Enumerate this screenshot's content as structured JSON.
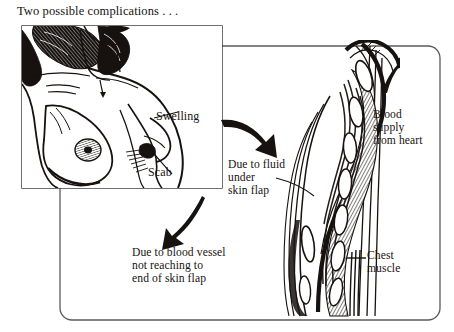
{
  "figure": {
    "title": "Two possible complications . . .",
    "background_color": "#ffffff",
    "ink_color": "#17120f",
    "frame_color": "#5b5b5b",
    "type": "medical-line-illustration"
  },
  "labels": {
    "swelling": "Swelling",
    "scab": "Scab",
    "fluid_cause": "Due to fluid\nunder\nskin flap",
    "vessel_cause": "Due to blood vessel\nnot reaching to\nend of skin flap",
    "blood_supply": "Blood\nsupply\nfrom heart",
    "chest_muscle": "Chest\nmuscle"
  },
  "panels": {
    "torso_panel_name": "torso-illustration-panel",
    "cross_section_name": "flap-cross-section-illustration"
  },
  "icons": {
    "arrow_to_fluid": "curved-arrow-down-right-icon",
    "arrow_to_vessel": "curved-arrow-down-left-icon",
    "arrow_blood_flow": "arrow-up-right-icon"
  }
}
